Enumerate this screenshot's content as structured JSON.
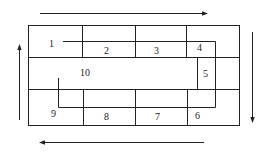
{
  "diagram": {
    "type": "block-layout-with-flow",
    "colors": {
      "line": "#222222",
      "background": "#ffffff"
    },
    "cells": [
      {
        "id": "1",
        "label": "1"
      },
      {
        "id": "2",
        "label": "2"
      },
      {
        "id": "3",
        "label": "3"
      },
      {
        "id": "4",
        "label": "4"
      },
      {
        "id": "5",
        "label": "5"
      },
      {
        "id": "6",
        "label": "6"
      },
      {
        "id": "7",
        "label": "7"
      },
      {
        "id": "8",
        "label": "8"
      },
      {
        "id": "9",
        "label": "9"
      },
      {
        "id": "10",
        "label": "10"
      }
    ],
    "arrows": [
      {
        "id": "top",
        "direction": "right"
      },
      {
        "id": "right",
        "direction": "down"
      },
      {
        "id": "bottom",
        "direction": "left"
      },
      {
        "id": "left",
        "direction": "up"
      }
    ]
  }
}
